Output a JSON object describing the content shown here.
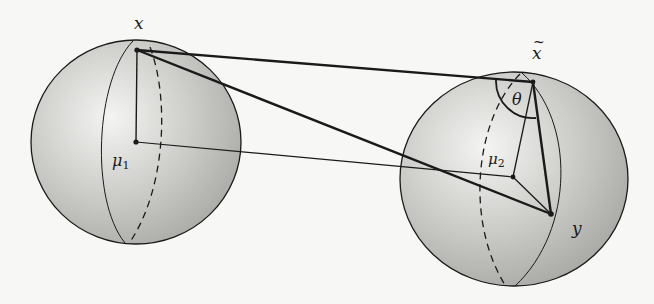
{
  "diagram": {
    "type": "two-spheres-geodesic",
    "colors": {
      "background": "#f7f7f5",
      "sphere_light": "#f0f0ee",
      "sphere_dark": "#a9a9a6",
      "stroke": "#1a1a1a"
    },
    "spheres": [
      {
        "name": "left",
        "cx": 136,
        "cy": 142,
        "rx": 105,
        "ry": 102
      },
      {
        "name": "right",
        "cx": 514,
        "cy": 179,
        "rx": 114,
        "ry": 107
      }
    ],
    "points": {
      "x": {
        "x": 137,
        "y": 50
      },
      "mu1": {
        "x": 136,
        "y": 142
      },
      "x_tilde": {
        "x": 533,
        "y": 82
      },
      "mu2": {
        "x": 513,
        "y": 177
      },
      "y": {
        "x": 551,
        "y": 214
      }
    },
    "labels": {
      "x": "x",
      "mu1_base": "μ",
      "mu1_sub": "1",
      "x_tilde": "x",
      "theta": "θ",
      "mu2_base": "μ",
      "mu2_sub": "2",
      "y": "y"
    }
  }
}
